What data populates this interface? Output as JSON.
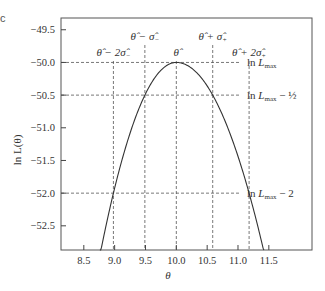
{
  "chart_data": {
    "type": "line",
    "title": "",
    "panel_label": "c",
    "xlabel": "θ",
    "ylabel": "ln L(θ)",
    "xlim": [
      8.13,
      12.2
    ],
    "ylim": [
      -52.87,
      -49.32
    ],
    "xticks": [
      8.5,
      9.0,
      9.5,
      10.0,
      10.5,
      11.0,
      11.5
    ],
    "xtick_labels": [
      "8.5",
      "9.0",
      "9.5",
      "10.0",
      "10.5",
      "11.0",
      "11.5"
    ],
    "yticks": [
      -49.5,
      -50.0,
      -50.5,
      -51.0,
      -51.5,
      -52.0,
      -52.5
    ],
    "ytick_labels": [
      "-49.5",
      "-50.0",
      "-50.5",
      "-51.0",
      "-51.5",
      "-52.0",
      "-52.5"
    ],
    "grid": false,
    "series": [
      {
        "name": "ln L(θ)",
        "model": "asymmetric parabola",
        "peak_theta": 10.0,
        "peak_lnL": -50.0,
        "sigma_minus": 0.51,
        "sigma_plus": 0.59,
        "x_range": [
          8.76,
          11.42
        ]
      }
    ],
    "vertical_markers": [
      {
        "x": 8.98,
        "label_main": "θ̂ − 2σ̂",
        "label_sub": "−",
        "row": "lower"
      },
      {
        "x": 9.49,
        "label_main": "θ̂ − σ̂",
        "label_sub": "−",
        "row": "upper"
      },
      {
        "x": 10.0,
        "label_main": "θ̂",
        "label_sub": "",
        "row": "lower"
      },
      {
        "x": 10.59,
        "label_main": "θ̂ + σ̂",
        "label_sub": "+",
        "row": "upper"
      },
      {
        "x": 11.18,
        "label_main": "θ̂ + 2σ̂",
        "label_sub": "+",
        "row": "lower"
      }
    ],
    "horizontal_markers": [
      {
        "y": -50.0,
        "label_main": "ln L",
        "label_sub": "max",
        "label_suffix": ""
      },
      {
        "y": -50.5,
        "label_main": "ln L",
        "label_sub": "max",
        "label_suffix": " − ½"
      },
      {
        "y": -52.0,
        "label_main": "ln L",
        "label_sub": "max",
        "label_suffix": " − 2"
      }
    ]
  }
}
